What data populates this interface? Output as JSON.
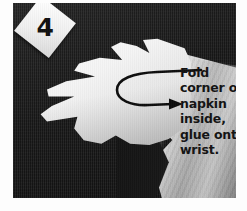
{
  "photo": {
    "kind": "craft-instruction-photograph",
    "description": "Black and white photo of a white paper hand cut-out on a dark table next to a folded white napkin",
    "step_label": "4",
    "background_color": "#171717",
    "napkin_color": "#d8d8d8",
    "hand_color": "#f6f6f6",
    "text_color": "#121212"
  },
  "caption": {
    "lines": [
      "Fold",
      "corner of",
      "napkin",
      "inside,",
      "glue onto",
      "wrist."
    ],
    "full_text": "Fold corner of napkin inside, glue onto wrist."
  },
  "annotation": {
    "arrow_name": "curved-fold-arrow",
    "arrow_direction": "loops left then points right"
  }
}
